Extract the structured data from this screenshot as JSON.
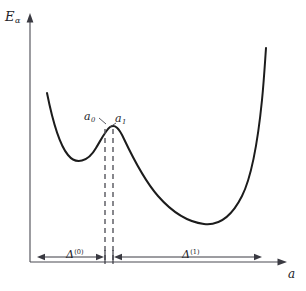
{
  "figure": {
    "domain": "chart",
    "background_color": "#ffffff",
    "curve_color": "#1c1c1c",
    "axis_color": "#4a4a52",
    "dashed_color": "#55555c"
  },
  "axes": {
    "y_label": "E",
    "y_label_subscript": "α",
    "x_label": "a",
    "x_label_subscript": "",
    "origin_px": [
      30,
      262
    ],
    "x_axis_end_px": [
      286,
      262
    ],
    "y_axis_top_px": [
      30,
      16
    ]
  },
  "annotations": {
    "a0_label": "a",
    "a0_subscript": "0",
    "a1_label": "a",
    "a1_subscript": "1",
    "delta0_label": "Δ",
    "delta0_superscript": "(0)",
    "delta1_label": "Δ",
    "delta1_superscript": "(1)"
  },
  "chart_data": {
    "type": "line",
    "title": "",
    "subtitle": "",
    "xlabel": "a",
    "ylabel": "E_α",
    "xlim": [
      30,
      286
    ],
    "ylim": [
      262,
      16
    ],
    "grid": false,
    "legend": null,
    "axis_ticks": {
      "x": [],
      "y": []
    },
    "series": [
      {
        "name": "E_alpha(a)",
        "description": "Double-well potential energy curve: steep left branch descending into a shallow local minimum, rising to a local maximum barrier, falling into a deep global minimum, then rising steeply on the right.",
        "path": "M 47,93 C 52,118 58,143 68,155 C 76,165 88,162 96,148 C 102,138 106,130 110,127 C 115,124 119,128 124,139 C 133,158 144,180 158,196 C 172,212 188,222 204,224 C 220,226 232,216 242,196 C 252,176 258,140 262,100 C 264,80 265,62 266,48",
        "points": [
          {
            "a": 47,
            "E": 93,
            "note": "left branch top"
          },
          {
            "a": 68,
            "E": 155,
            "note": "descending"
          },
          {
            "a": 81,
            "E": 161,
            "note": "local minimum (shallow well)"
          },
          {
            "a": 96,
            "E": 148,
            "note": "ascending to barrier"
          },
          {
            "a": 110,
            "E": 127,
            "note": "local maximum (barrier peak)"
          },
          {
            "a": 124,
            "E": 139,
            "note": "descending from barrier"
          },
          {
            "a": 158,
            "E": 196,
            "note": "descending"
          },
          {
            "a": 204,
            "E": 224,
            "note": "global minimum (deep well)"
          },
          {
            "a": 242,
            "E": 196,
            "note": "rising"
          },
          {
            "a": 262,
            "E": 100,
            "note": "steep rise"
          },
          {
            "a": 266,
            "E": 48,
            "note": "right branch top"
          }
        ]
      }
    ],
    "markers": [
      {
        "name": "a0",
        "x_px": 105,
        "label": "a₀",
        "type": "vertical-dashed-line",
        "from_y_px": 129,
        "to_y_px": 262
      },
      {
        "name": "a1",
        "x_px": 113,
        "label": "a₁",
        "type": "vertical-dashed-line",
        "from_y_px": 129,
        "to_y_px": 262
      }
    ],
    "measures": [
      {
        "name": "delta0",
        "label": "Δ⁽⁰⁾",
        "from_x_px": 37,
        "to_x_px": 104,
        "y_px": 257
      },
      {
        "name": "delta1",
        "label": "Δ⁽¹⁾",
        "from_x_px": 114,
        "to_x_px": 262,
        "y_px": 257
      }
    ]
  }
}
